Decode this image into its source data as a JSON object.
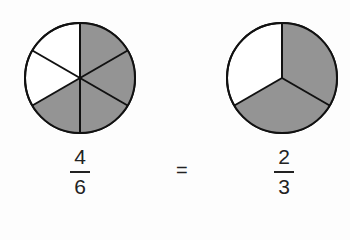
{
  "diagram": {
    "colors": {
      "shaded": "#949494",
      "unshaded": "#ffffff",
      "stroke": "#111111"
    },
    "left": {
      "numerator": "4",
      "denominator": "6",
      "segments": 6,
      "shaded": 4
    },
    "operator": "=",
    "right": {
      "numerator": "2",
      "denominator": "3",
      "segments": 3,
      "shaded": 2
    }
  }
}
